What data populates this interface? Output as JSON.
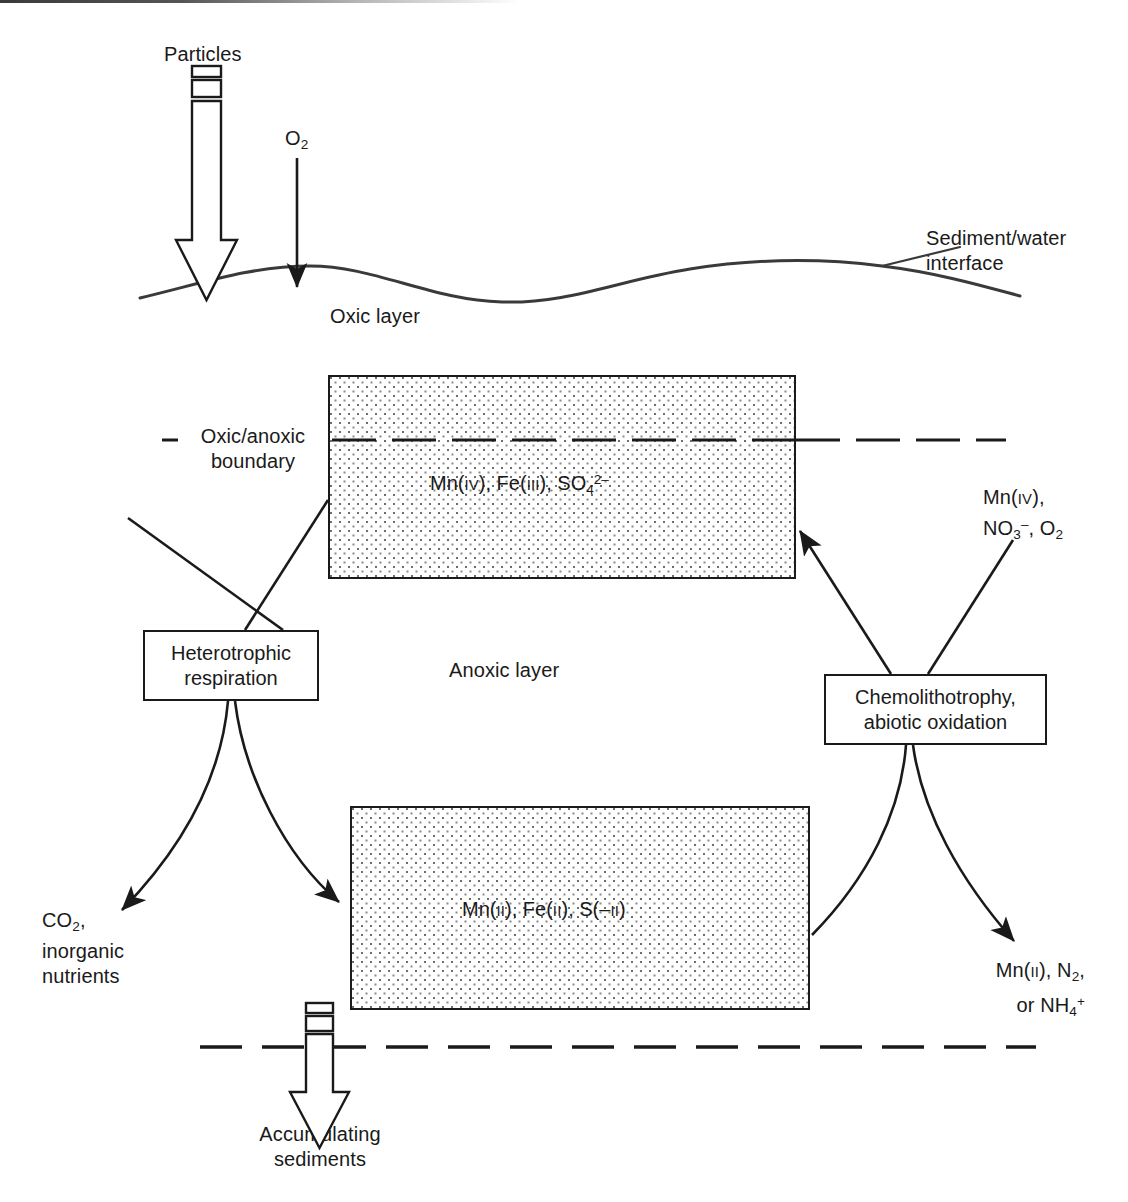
{
  "figure": {
    "background": "#ffffff",
    "line_color": "#1a1a1a",
    "stipple_color": "#7d7d7d"
  },
  "labels": {
    "particles": "Particles",
    "o2_input": "O2",
    "sediment_water_interface_line1": "Sediment/water",
    "sediment_water_interface_line2": "interface",
    "oxic_layer": "Oxic layer",
    "oxic_anoxic_boundary_line1": "Oxic/anoxic",
    "oxic_anoxic_boundary_line2": "boundary",
    "anoxic_layer": "Anoxic layer",
    "accumulating_line1": "Accumulating",
    "accumulating_line2": "sediments"
  },
  "pools": [
    {
      "id": "oxidized-pool",
      "species": "Mn(IV), Fe(III), SO4 2-",
      "parts": [
        {
          "text": "Mn(",
          "style": "normal"
        },
        {
          "text": "IV",
          "style": "smallcaps"
        },
        {
          "text": "), Fe(",
          "style": "normal"
        },
        {
          "text": "III",
          "style": "smallcaps"
        },
        {
          "text": "), SO",
          "style": "normal"
        },
        {
          "text": "4",
          "style": "sub"
        },
        {
          "text": "2–",
          "style": "sup"
        }
      ]
    },
    {
      "id": "reduced-pool",
      "species": "Mn(II), Fe(II), S(-II)",
      "parts": [
        {
          "text": "Mn(",
          "style": "normal"
        },
        {
          "text": "II",
          "style": "smallcaps"
        },
        {
          "text": "), Fe(",
          "style": "normal"
        },
        {
          "text": "II",
          "style": "smallcaps"
        },
        {
          "text": "), S(–",
          "style": "normal"
        },
        {
          "text": "II",
          "style": "smallcaps"
        },
        {
          "text": ")",
          "style": "normal"
        }
      ]
    }
  ],
  "processes": [
    {
      "id": "heterotrophic-respiration",
      "line1": "Heterotrophic",
      "line2": "respiration"
    },
    {
      "id": "chemolithotrophy",
      "line1": "Chemolithotrophy,",
      "line2": "abiotic oxidation"
    }
  ],
  "flux_labels": {
    "oxidants_in_line1": "Mn(IV),",
    "oxidants_in_line2": "NO3-, O2",
    "products_left_line1": "CO2,",
    "products_left_line2": "inorganic",
    "products_left_line3": "nutrients",
    "products_right_line1": "Mn(II), N2,",
    "products_right_line2": "or NH4+"
  }
}
